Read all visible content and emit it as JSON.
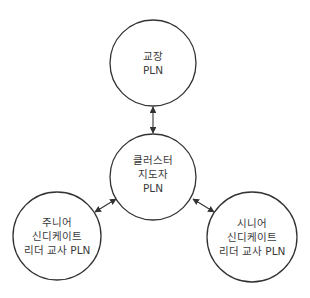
{
  "diagram": {
    "nodes": [
      {
        "id": "principal",
        "lines": [
          "교장",
          "PLN"
        ]
      },
      {
        "id": "cluster",
        "lines": [
          "클러스터",
          "지도자",
          "PLN"
        ]
      },
      {
        "id": "junior",
        "lines": [
          "주니어",
          "신디케이트",
          "리더 교사 PLN"
        ]
      },
      {
        "id": "senior",
        "lines": [
          "시니어",
          "신디케이트",
          "리더 교사 PLN"
        ]
      }
    ],
    "edges": [
      {
        "from": "principal",
        "to": "cluster",
        "type": "bidirectional"
      },
      {
        "from": "cluster",
        "to": "junior",
        "type": "bidirectional"
      },
      {
        "from": "cluster",
        "to": "senior",
        "type": "bidirectional"
      }
    ],
    "colors": {
      "stroke": "#333333",
      "text": "#3a3a3a",
      "background": "#ffffff"
    }
  }
}
